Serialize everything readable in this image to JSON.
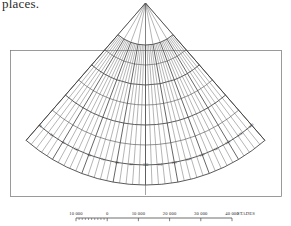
{
  "page": {
    "partial_text_top": "places."
  },
  "figure": {
    "apex": {
      "x": 145.5,
      "y": 3.0
    },
    "frame": {
      "x": 10.5,
      "y": 50.5,
      "width": 271.0,
      "height": 146.0
    },
    "projection": {
      "type": "simple-conic",
      "half_angle_deg": 41.0,
      "radii": [
        42,
        62,
        82,
        102,
        122,
        142,
        162,
        182
      ],
      "major_radii": [
        42,
        82,
        122,
        162,
        182
      ],
      "meridian_step_deg": 2.05,
      "meridian_count": 41,
      "major_meridian_every": 5
    },
    "graticule_labels_bottom": [
      "20",
      "30",
      "40",
      "50",
      "60",
      "70",
      "80",
      "90",
      "100",
      "110",
      "120",
      "130",
      "140",
      "150",
      "160",
      "170",
      "180"
    ],
    "graticule_labels_left": [
      "20",
      "30",
      "40",
      "50",
      "60",
      "70"
    ],
    "graticule_labels_right": [
      "1 30",
      "1 40",
      "1 50",
      "1 60",
      "1 70",
      "1 80"
    ]
  },
  "scale": {
    "unit_label": "STADES",
    "labels": [
      "10 000",
      "0",
      "10 000",
      "20 000",
      "30 000",
      "40 000"
    ],
    "values": [
      -10000,
      0,
      10000,
      20000,
      30000,
      40000
    ],
    "bar": {
      "x0": 76.0,
      "x1": 232.0,
      "y": 218.0,
      "step": 31.2
    },
    "subdivisions_left": 10
  }
}
